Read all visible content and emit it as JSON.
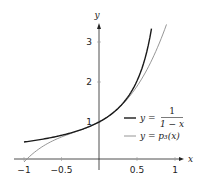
{
  "chart_data": {
    "type": "line",
    "title": "",
    "xlabel": "x",
    "ylabel": "y",
    "xlim": [
      -1.05,
      1.1
    ],
    "ylim": [
      0,
      3.5
    ],
    "grid": false,
    "legend_position": "lower right",
    "x_ticks": [
      "-1",
      "-0.5",
      "0.5",
      "1"
    ],
    "y_ticks": [
      "1",
      "2",
      "3"
    ],
    "series": [
      {
        "name": "y = 1/(1 - x)",
        "color": "#1a1a1a",
        "x": [
          -1,
          -0.75,
          -0.5,
          -0.25,
          0,
          0.25,
          0.5,
          0.6,
          0.7
        ],
        "values": [
          0.5,
          0.571,
          0.667,
          0.8,
          1,
          1.333,
          2,
          2.5,
          3.333
        ]
      },
      {
        "name": "y = p3(x)",
        "color": "#8a8a8a",
        "x": [
          -1,
          -0.75,
          -0.5,
          -0.25,
          0,
          0.25,
          0.5,
          0.75,
          0.9
        ],
        "values": [
          0,
          0.484,
          0.625,
          0.797,
          1,
          1.328,
          1.875,
          2.734,
          3.439
        ]
      }
    ]
  },
  "axes": {
    "x_label": "x",
    "y_label": "y",
    "x_tick_labels": [
      "−1",
      "−0.5",
      "0.5",
      "1"
    ],
    "y_tick_labels": [
      "1",
      "2",
      "3"
    ]
  },
  "legend": {
    "items": [
      {
        "prefix": "y = ",
        "numerator": "1",
        "denominator": "1 − x",
        "color": "#1a1a1a"
      },
      {
        "text": "y = p₃(x)",
        "color": "#8a8a8a"
      }
    ]
  }
}
